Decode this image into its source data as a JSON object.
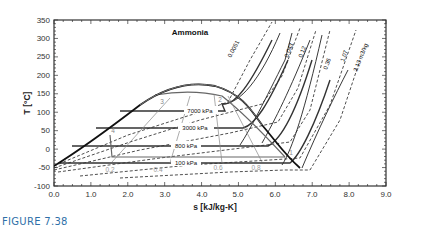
{
  "figure": {
    "caption": "FIGURE 7.38"
  },
  "chart_data": {
    "type": "line",
    "title": "Ammonia",
    "xlabel": "s [kJ/kg-K]",
    "ylabel": "T [°C]",
    "xlim": [
      0.0,
      9.0
    ],
    "ylim": [
      -100,
      350
    ],
    "x_ticks": [
      "0.0",
      "1.0",
      "2.0",
      "3.0",
      "4.0",
      "5.0",
      "6.0",
      "7.0",
      "8.0",
      "9.0"
    ],
    "y_ticks": [
      "-100",
      "-50",
      "0",
      "50",
      "100",
      "150",
      "200",
      "250",
      "300",
      "350"
    ],
    "grid": false,
    "legend": null,
    "saturation_dome": {
      "name": "saturation curve",
      "points": [
        [
          0.0,
          -50
        ],
        [
          0.5,
          -30
        ],
        [
          1.0,
          0
        ],
        [
          1.5,
          30
        ],
        [
          2.0,
          60
        ],
        [
          2.5,
          90
        ],
        [
          3.0,
          115
        ],
        [
          3.5,
          130
        ],
        [
          3.9,
          132
        ],
        [
          4.3,
          125
        ],
        [
          4.7,
          105
        ],
        [
          5.0,
          80
        ],
        [
          5.5,
          50
        ],
        [
          6.0,
          15
        ],
        [
          6.6,
          -30
        ]
      ]
    },
    "isobars": [
      {
        "label": "7000 kPa",
        "pressure_kPa": 7000,
        "T_sat": 113
      },
      {
        "label": "3000 kPa",
        "pressure_kPa": 3000,
        "T_sat": 68
      },
      {
        "label": "800 kPa",
        "pressure_kPa": 800,
        "T_sat": 18
      },
      {
        "label": "100 kPa",
        "pressure_kPa": 100,
        "T_sat": -33
      }
    ],
    "specific_volume_lines": {
      "unit": "m3/kg",
      "labels": [
        "0.0051",
        "0.043",
        "0.12",
        "0.36",
        "1.07",
        "3.13 m3/kg"
      ],
      "values": [
        0.0051,
        0.043,
        0.12,
        0.36,
        1.07,
        3.13
      ]
    },
    "quality_lines": {
      "labels": [
        "0.2",
        "0.4",
        "0.6",
        "0.8"
      ],
      "values": [
        0.2,
        0.4,
        0.6,
        0.8
      ]
    },
    "cycle_points": [
      {
        "label": "1",
        "s": 6.05,
        "T": -22
      },
      {
        "label": "2",
        "s": 4.35,
        "T": 122
      },
      {
        "label": "3",
        "s": 2.95,
        "T": 120
      },
      {
        "label": "4",
        "s": 1.55,
        "T": 36
      },
      {
        "label": "5",
        "s": 1.55,
        "T": -22
      }
    ],
    "annotations": [
      "Ammonia",
      "1",
      "2",
      "3",
      "4",
      "0.2",
      "0.4",
      "0.6",
      "0.8"
    ]
  }
}
